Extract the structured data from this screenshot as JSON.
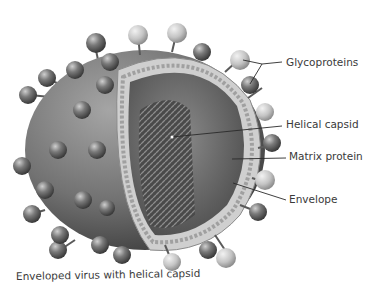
{
  "figure": {
    "caption": "Enveloped virus with helical capsid",
    "colors": {
      "background": "#ffffff",
      "shell": "#7a7a7a",
      "shell_dark": "#4e4e4e",
      "knob_dark": "#5c5c5c",
      "knob_light": "#bdbdbd",
      "membrane": "#cfcfcf",
      "capsid": "#5a5a5a",
      "leader": "#2a2a2a",
      "text": "#3a3a3a"
    },
    "labels": [
      {
        "id": "glycoproteins",
        "text": "Glycoproteins"
      },
      {
        "id": "helical-capsid",
        "text": "Helical capsid"
      },
      {
        "id": "matrix-protein",
        "text": "Matrix protein"
      },
      {
        "id": "envelope",
        "text": "Envelope"
      }
    ]
  }
}
